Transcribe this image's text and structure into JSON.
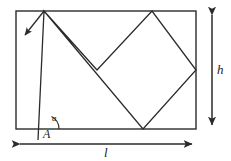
{
  "figure": {
    "type": "geometry-diagram",
    "background_color": "#ffffff",
    "stroke_color": "#2b2b2b",
    "labels": {
      "height": "h",
      "length": "l",
      "vertex": "A",
      "angle": "a"
    },
    "rectangle": {
      "x": 16,
      "y": 11,
      "width": 180,
      "height": 118
    },
    "path_points": [
      [
        38,
        140
      ],
      [
        44,
        11
      ],
      [
        143,
        129
      ],
      [
        196,
        70
      ],
      [
        152,
        11
      ],
      [
        97,
        70
      ],
      [
        44,
        11
      ],
      [
        23,
        37
      ]
    ],
    "dimension_lines": [
      {
        "name": "height-dimension",
        "orientation": "vertical",
        "x": 212,
        "y1": 11,
        "y2": 129,
        "label": "h"
      },
      {
        "name": "length-dimension",
        "orientation": "horizontal",
        "y": 144,
        "x1": 16,
        "x2": 196,
        "label": "l"
      }
    ],
    "direction_arrow": {
      "name": "direction-arrow",
      "from": [
        44,
        11
      ],
      "to": [
        23,
        37
      ]
    },
    "angle_arc": {
      "name": "angle-arc",
      "center": [
        45,
        129
      ],
      "radius": 14,
      "label": "a"
    }
  }
}
